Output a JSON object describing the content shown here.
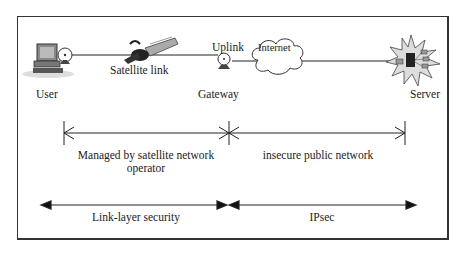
{
  "nodes": {
    "user": {
      "label": "User",
      "icon": "computer-with-dish-icon"
    },
    "satellite": {
      "label": "Satellite link",
      "icon": "satellite-icon"
    },
    "uplink": {
      "label": "Uplink",
      "icon": "satellite-dish-icon"
    },
    "gateway": {
      "label": "Gateway"
    },
    "internet": {
      "label": "Internet",
      "icon": "cloud-icon"
    },
    "server": {
      "label": "Server",
      "icon": "server-burst-icon"
    }
  },
  "spans": {
    "managed": {
      "line1": "Managed by satellite network",
      "line2": "operator"
    },
    "public": {
      "label": "insecure public network"
    }
  },
  "security": {
    "link_layer": {
      "label": "Link-layer security"
    },
    "ipsec": {
      "label": "IPsec"
    }
  }
}
